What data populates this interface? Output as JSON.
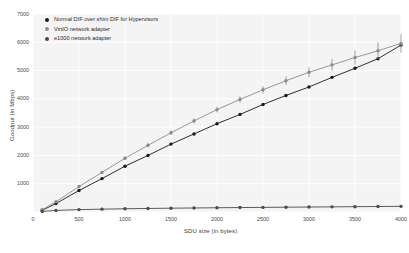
{
  "chart_data": {
    "type": "line",
    "title": "",
    "xlabel": "SDU size (in bytes)",
    "ylabel": "Goodput (in Mbps)",
    "xlim": [
      0,
      4000
    ],
    "ylim": [
      0,
      7000
    ],
    "xticks": [
      0,
      500,
      1000,
      1500,
      2000,
      2500,
      3000,
      3500,
      4000
    ],
    "yticks": [
      0,
      1000,
      2000,
      3000,
      4000,
      5000,
      6000,
      7000
    ],
    "grid": true,
    "legend_position": "upper left",
    "x": [
      100,
      250,
      500,
      750,
      1000,
      1250,
      1500,
      1750,
      2000,
      2250,
      2500,
      2750,
      3000,
      3250,
      3500,
      3750,
      4000
    ],
    "series": [
      {
        "name": "Normal DIF over shim DIF for Hypervisors",
        "color": "#1a1a1a",
        "marker": "circle",
        "values": [
          60,
          300,
          760,
          1180,
          1620,
          2000,
          2400,
          2760,
          3120,
          3450,
          3800,
          4120,
          4420,
          4760,
          5080,
          5420,
          5900
        ]
      },
      {
        "name": "VirtIO network adapter",
        "color": "#8c8c8c",
        "marker": "circle",
        "has_error_bars": true,
        "values": [
          80,
          360,
          900,
          1400,
          1900,
          2360,
          2800,
          3220,
          3620,
          3980,
          4320,
          4640,
          4940,
          5200,
          5460,
          5700,
          5960
        ],
        "errors": [
          20,
          30,
          40,
          50,
          60,
          70,
          80,
          90,
          100,
          110,
          130,
          150,
          180,
          210,
          250,
          300,
          330
        ]
      },
      {
        "name": "e1000 network adapter",
        "color": "#4a4a4a",
        "marker": "circle",
        "values": [
          20,
          55,
          85,
          100,
          115,
          125,
          135,
          142,
          150,
          157,
          163,
          170,
          176,
          182,
          188,
          194,
          200
        ]
      }
    ]
  },
  "legend": {
    "items": [
      {
        "label": "Normal DIF over shim DIF for Hypervisors",
        "color": "#1a1a1a"
      },
      {
        "label": "VirtIO network adapter",
        "color": "#8c8c8c"
      },
      {
        "label": "e1000 network adapter",
        "color": "#4a4a4a"
      }
    ]
  }
}
